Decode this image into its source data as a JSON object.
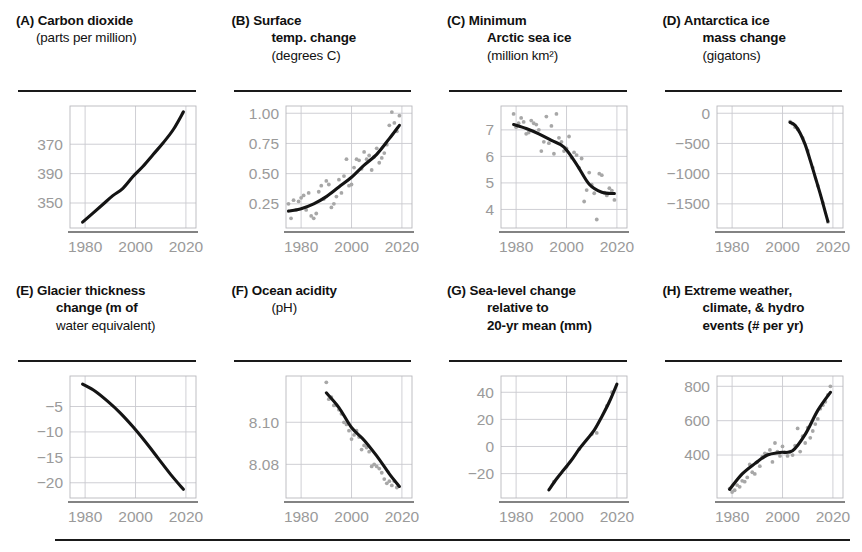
{
  "figure": {
    "panel_count": 8,
    "xticks": [
      "1980",
      "2000",
      "2020"
    ],
    "xlim": [
      1974,
      2024
    ]
  },
  "panels": [
    {
      "id": "A",
      "tag": "(A)",
      "title_bold": "Carbon dioxide",
      "title_regular": "(parts per million)",
      "title_lines": [
        "(A) Carbon dioxide",
        "(parts per million)"
      ],
      "chart_data": {
        "type": "line",
        "title": "Carbon dioxide (parts per million)",
        "xlabel": "",
        "ylabel": "parts per million",
        "xlim": [
          1974,
          2024
        ],
        "ylim": [
          333,
          416
        ],
        "yticks": [
          350,
          370,
          390
        ],
        "ytick_labels": [
          "350",
          "390",
          "370"
        ],
        "grid": true,
        "series": [
          {
            "name": "CO2 concentration",
            "x": [
              1979,
              1983,
              1987,
              1991,
              1995,
              1999,
              2003,
              2007,
              2011,
              2015,
              2019
            ],
            "values": [
              337,
              343,
              349,
              355,
              360,
              368,
              375,
              383,
              391,
              400,
              412
            ]
          }
        ],
        "scatter": []
      }
    },
    {
      "id": "B",
      "tag": "(B)",
      "title_bold": "Surface temp. change",
      "title_regular": "(degrees C)",
      "title_lines": [
        "(B) Surface",
        "temp. change",
        "(degrees C)"
      ],
      "chart_data": {
        "type": "scatter",
        "title": "Surface temp. change (degrees C)",
        "xlabel": "",
        "ylabel": "degrees C",
        "xlim": [
          1974,
          2024
        ],
        "ylim": [
          0.05,
          1.06
        ],
        "yticks": [
          0.25,
          0.5,
          0.75,
          1.0
        ],
        "ytick_labels": [
          "0.25",
          "0.50",
          "0.75",
          "1.00"
        ],
        "grid": true,
        "series": [
          {
            "name": "smoothed trend",
            "x": [
              1975,
              1980,
              1985,
              1990,
              1995,
              2000,
              2005,
              2010,
              2015,
              2019
            ],
            "values": [
              0.19,
              0.21,
              0.25,
              0.31,
              0.39,
              0.47,
              0.57,
              0.66,
              0.79,
              0.9
            ]
          }
        ],
        "scatter": {
          "name": "annual anomaly",
          "x": [
            1975,
            1976,
            1977,
            1978,
            1979,
            1980,
            1981,
            1982,
            1983,
            1984,
            1985,
            1986,
            1987,
            1988,
            1989,
            1990,
            1991,
            1992,
            1993,
            1994,
            1995,
            1996,
            1997,
            1998,
            1999,
            2000,
            2001,
            2002,
            2003,
            2004,
            2005,
            2006,
            2007,
            2008,
            2009,
            2010,
            2011,
            2012,
            2013,
            2014,
            2015,
            2016,
            2017,
            2018,
            2019
          ],
          "values": [
            0.25,
            0.13,
            0.28,
            0.2,
            0.27,
            0.3,
            0.32,
            0.2,
            0.34,
            0.15,
            0.13,
            0.17,
            0.35,
            0.4,
            0.29,
            0.44,
            0.41,
            0.22,
            0.25,
            0.31,
            0.45,
            0.34,
            0.48,
            0.62,
            0.4,
            0.41,
            0.55,
            0.62,
            0.61,
            0.54,
            0.68,
            0.62,
            0.65,
            0.53,
            0.64,
            0.71,
            0.59,
            0.63,
            0.67,
            0.74,
            0.9,
            1.01,
            0.92,
            0.85,
            0.98
          ]
        }
      }
    },
    {
      "id": "C",
      "tag": "(C)",
      "title_bold": "Minimum Arctic sea ice",
      "title_regular": "(million km²)",
      "title_lines": [
        "(C) Minimum",
        "Arctic sea ice",
        "(million km²)"
      ],
      "chart_data": {
        "type": "scatter",
        "title": "Minimum Arctic sea ice (million km²)",
        "xlabel": "",
        "ylabel": "million km²",
        "xlim": [
          1974,
          2024
        ],
        "ylim": [
          3.3,
          7.9
        ],
        "yticks": [
          4,
          5,
          6,
          7
        ],
        "ytick_labels": [
          "4",
          "5",
          "6",
          "7"
        ],
        "grid": true,
        "series": [
          {
            "name": "smoothed trend",
            "x": [
              1979,
              1984,
              1989,
              1994,
              1999,
              2004,
              2009,
              2014,
              2019
            ],
            "values": [
              7.2,
              7.05,
              6.85,
              6.6,
              6.35,
              5.7,
              4.95,
              4.65,
              4.6
            ]
          }
        ],
        "scatter": {
          "name": "annual minimum extent",
          "x": [
            1979,
            1980,
            1981,
            1982,
            1983,
            1984,
            1985,
            1986,
            1987,
            1988,
            1989,
            1990,
            1991,
            1992,
            1993,
            1994,
            1995,
            1996,
            1997,
            1998,
            1999,
            2000,
            2001,
            2002,
            2003,
            2004,
            2005,
            2006,
            2007,
            2008,
            2009,
            2010,
            2011,
            2012,
            2013,
            2014,
            2015,
            2016,
            2017,
            2018,
            2019
          ],
          "values": [
            7.6,
            7.1,
            7.25,
            7.45,
            7.3,
            6.85,
            6.9,
            7.35,
            7.25,
            7.2,
            7.0,
            6.2,
            6.55,
            7.5,
            6.5,
            7.15,
            6.1,
            7.6,
            6.7,
            6.55,
            6.2,
            6.3,
            6.75,
            5.95,
            6.15,
            6.05,
            5.57,
            5.92,
            4.3,
            4.73,
            5.39,
            4.93,
            4.61,
            3.62,
            5.35,
            5.29,
            4.63,
            4.53,
            4.8,
            4.71,
            4.36
          ]
        }
      }
    },
    {
      "id": "D",
      "tag": "(D)",
      "title_bold": "Antarctica ice mass change",
      "title_regular": "(gigatons)",
      "title_lines": [
        "(D) Antarctica ice",
        "mass change",
        "(gigatons)"
      ],
      "chart_data": {
        "type": "line",
        "title": "Antarctica ice mass change (gigatons)",
        "xlabel": "",
        "ylabel": "gigatons",
        "xlim": [
          1974,
          2024
        ],
        "ylim": [
          -1900,
          120
        ],
        "yticks": [
          0,
          -500,
          -1000,
          -1500
        ],
        "ytick_labels": [
          "0",
          "−500",
          "−1000",
          "−1500"
        ],
        "grid": true,
        "series": [
          {
            "name": "cumulative mass change",
            "x": [
              2003,
              2005,
              2007,
              2009,
              2011,
              2013,
              2015,
              2017,
              2018
            ],
            "values": [
              -150,
              -200,
              -330,
              -520,
              -780,
              -1060,
              -1340,
              -1640,
              -1790
            ]
          }
        ],
        "scatter": {
          "name": "measured mass change",
          "x": [
            2003,
            2004,
            2005,
            2006,
            2008,
            2010,
            2012,
            2014,
            2016,
            2018
          ],
          "values": [
            -140,
            -175,
            -230,
            -265,
            -410,
            -620,
            -900,
            -1200,
            -1480,
            -1800
          ]
        }
      }
    },
    {
      "id": "E",
      "tag": "(E)",
      "title_bold": "Glacier thickness change",
      "title_regular": "(m of water equivalent)",
      "title_lines": [
        "(E) Glacier thickness",
        "change (m of",
        "water equivalent)"
      ],
      "chart_data": {
        "type": "line",
        "title": "Glacier thickness change (m of water equivalent)",
        "xlabel": "",
        "ylabel": "m of water equivalent",
        "xlim": [
          1974,
          2024
        ],
        "ylim": [
          -23,
          1
        ],
        "yticks": [
          -5,
          -10,
          -15,
          -20
        ],
        "ytick_labels": [
          "−5",
          "−10",
          "−15",
          "−20"
        ],
        "grid": true,
        "series": [
          {
            "name": "cumulative thickness change",
            "x": [
              1979,
              1984,
              1989,
              1994,
              1999,
              2004,
              2009,
              2014,
              2019
            ],
            "values": [
              -0.6,
              -2.0,
              -4.0,
              -6.3,
              -9.0,
              -12.0,
              -15.2,
              -18.4,
              -21.3
            ]
          }
        ],
        "scatter": []
      }
    },
    {
      "id": "F",
      "tag": "(F)",
      "title_bold": "Ocean acidity",
      "title_regular": "(pH)",
      "title_lines": [
        "(F) Ocean acidity",
        "(pH)"
      ],
      "chart_data": {
        "type": "scatter",
        "title": "Ocean acidity (pH)",
        "xlabel": "",
        "ylabel": "pH",
        "xlim": [
          1974,
          2024
        ],
        "ylim": [
          8.064,
          8.122
        ],
        "yticks": [
          8.08,
          8.1
        ],
        "ytick_labels": [
          "8.08",
          "8.10"
        ],
        "grid": true,
        "series": [
          {
            "name": "smoothed trend",
            "x": [
              1990,
              1995,
              2000,
              2005,
              2010,
              2015,
              2019
            ],
            "values": [
              8.114,
              8.107,
              8.0975,
              8.0915,
              8.084,
              8.0755,
              8.0695
            ]
          }
        ],
        "scatter": {
          "name": "measured pH",
          "x": [
            1990,
            1991,
            1992,
            1993,
            1994,
            1995,
            1996,
            1997,
            1998,
            1999,
            2000,
            2001,
            2002,
            2003,
            2004,
            2005,
            2006,
            2007,
            2008,
            2009,
            2010,
            2011,
            2012,
            2013,
            2014,
            2015,
            2016,
            2017,
            2018
          ],
          "values": [
            8.119,
            8.111,
            8.112,
            8.108,
            8.108,
            8.106,
            8.104,
            8.1,
            8.099,
            8.096,
            8.092,
            8.094,
            8.096,
            8.093,
            8.087,
            8.089,
            8.088,
            8.086,
            8.079,
            8.08,
            8.079,
            8.078,
            8.076,
            8.073,
            8.071,
            8.072,
            8.07,
            8.072,
            8.069
          ]
        }
      }
    },
    {
      "id": "G",
      "tag": "(G)",
      "title_bold": "Sea-level change relative to 20-yr mean",
      "title_regular": "(mm)",
      "title_lines": [
        "(G) Sea-level change",
        "relative to",
        "20-yr mean (mm)"
      ],
      "chart_data": {
        "type": "line",
        "title": "Sea-level change relative to 20-yr mean (mm)",
        "xlabel": "",
        "ylabel": "mm",
        "xlim": [
          1974,
          2024
        ],
        "ylim": [
          -38,
          52
        ],
        "yticks": [
          -20,
          0,
          20,
          40
        ],
        "ytick_labels": [
          "−20",
          "0",
          "20",
          "40"
        ],
        "grid": true,
        "series": [
          {
            "name": "sea-level anomaly",
            "x": [
              1993,
              1996,
              1999,
              2002,
              2005,
              2008,
              2011,
              2014,
              2017,
              2020
            ],
            "values": [
              -32,
              -24,
              -17,
              -10,
              -2,
              5,
              12,
              22,
              33,
              46
            ]
          }
        ],
        "scatter": {
          "name": "measured anomaly",
          "x": [
            1995,
            2000,
            2005,
            2010,
            2012,
            2016,
            2018
          ],
          "values": [
            -26,
            -15,
            -2,
            9,
            10,
            30,
            40
          ]
        }
      }
    },
    {
      "id": "H",
      "tag": "(H)",
      "title_bold": "Extreme weather, climate, & hydro events",
      "title_regular": "(# per yr)",
      "title_lines": [
        "(H) Extreme weather,",
        "climate, & hydro",
        "events (# per yr)"
      ],
      "chart_data": {
        "type": "scatter",
        "title": "Extreme weather, climate, & hydro events (# per yr)",
        "xlabel": "",
        "ylabel": "# per yr",
        "xlim": [
          1974,
          2024
        ],
        "ylim": [
          150,
          860
        ],
        "yticks": [
          400,
          600,
          800
        ],
        "ytick_labels": [
          "400",
          "600",
          "800"
        ],
        "grid": true,
        "series": [
          {
            "name": "smoothed trend",
            "x": [
              1979,
              1984,
              1989,
              1994,
              1999,
              2004,
              2009,
              2014,
              2019
            ],
            "values": [
              200,
              290,
              350,
              400,
              415,
              425,
              520,
              660,
              765
            ]
          }
        ],
        "scatter": {
          "name": "annual event count",
          "x": [
            1979,
            1980,
            1981,
            1982,
            1983,
            1984,
            1985,
            1986,
            1987,
            1988,
            1989,
            1990,
            1991,
            1992,
            1993,
            1994,
            1995,
            1996,
            1997,
            1998,
            1999,
            2000,
            2001,
            2002,
            2003,
            2004,
            2005,
            2006,
            2007,
            2008,
            2009,
            2010,
            2011,
            2012,
            2013,
            2014,
            2015,
            2016,
            2017,
            2018,
            2019
          ],
          "values": [
            205,
            185,
            195,
            225,
            215,
            250,
            245,
            270,
            345,
            300,
            290,
            360,
            335,
            390,
            410,
            405,
            430,
            360,
            470,
            420,
            395,
            450,
            415,
            395,
            420,
            400,
            455,
            555,
            420,
            510,
            470,
            560,
            500,
            540,
            580,
            610,
            670,
            690,
            710,
            750,
            800
          ]
        }
      }
    }
  ]
}
